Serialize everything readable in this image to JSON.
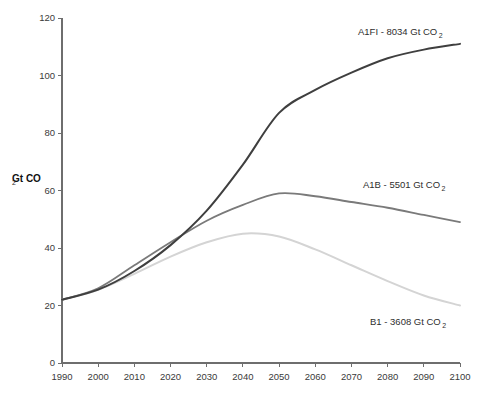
{
  "chart_data": {
    "type": "line",
    "title": "",
    "subtitle": "",
    "xlabel": "",
    "ylabel": "Gt CO",
    "ylabel_sub": "2",
    "xlim": [
      1990,
      2100
    ],
    "ylim": [
      0,
      120
    ],
    "grid": false,
    "legend_position": "inline-annotations",
    "x_ticks": [
      "1990",
      "2000",
      "2010",
      "2020",
      "2030",
      "2040",
      "2050",
      "2060",
      "2070",
      "2080",
      "2090",
      "2100"
    ],
    "y_ticks": [
      "0",
      "20",
      "40",
      "60",
      "80",
      "100",
      "120"
    ],
    "x": [
      1990,
      2000,
      2010,
      2020,
      2030,
      2040,
      2050,
      2060,
      2070,
      2080,
      2090,
      2100
    ],
    "series": [
      {
        "name": "A1FI",
        "label": "A1FI - 8034 Gt CO",
        "label_sub": "2",
        "cumulative_gt_co2": 8034,
        "color": "#3f3f3f",
        "width": 2.0,
        "values": [
          22,
          25.5,
          32,
          41,
          53,
          69,
          87,
          95,
          101,
          106,
          109,
          111
        ]
      },
      {
        "name": "A1B",
        "label": "A1B - 5501 Gt CO",
        "label_sub": "2",
        "cumulative_gt_co2": 5501,
        "color": "#7a7a7a",
        "width": 1.8,
        "values": [
          22,
          26,
          34,
          42,
          49.5,
          55,
          59,
          58,
          56,
          54,
          51.5,
          49
        ]
      },
      {
        "name": "B1",
        "label": "B1 - 3608 Gt CO",
        "label_sub": "2",
        "cumulative_gt_co2": 3608,
        "color": "#d4d4d4",
        "width": 2.0,
        "values": [
          22,
          25.5,
          31,
          37,
          42,
          45,
          44,
          39.5,
          34,
          28.5,
          23.5,
          20
        ]
      }
    ],
    "annotations": [
      {
        "id": "a1fi-annotation",
        "series": "A1FI",
        "text": "A1FI - 8034 Gt CO",
        "sub": "2",
        "x_px": 358,
        "y_px": 35
      },
      {
        "id": "a1b-annotation",
        "series": "A1B",
        "text": "A1B - 5501 Gt CO",
        "sub": "2",
        "x_px": 363,
        "y_px": 188
      },
      {
        "id": "b1-annotation",
        "series": "B1",
        "text": "B1 - 3608 Gt CO",
        "sub": "2",
        "x_px": 370,
        "y_px": 325
      }
    ]
  }
}
